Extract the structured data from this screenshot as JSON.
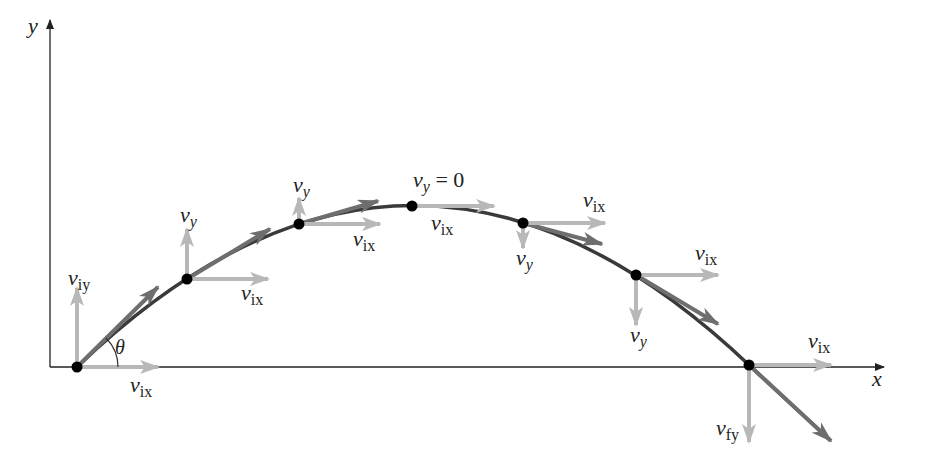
{
  "diagram": {
    "axes": {
      "x_label": "x",
      "y_label": "y"
    },
    "colors": {
      "axis": "#222222",
      "trajectory": "#3a3a3a",
      "velocity_vector": "#6e6e6e",
      "component_vector": "#b8b8b8",
      "point": "#000000"
    },
    "angle_label": "θ",
    "points": [
      {
        "id": "launch",
        "x": 77,
        "y": 367,
        "vx_label": "v",
        "vx_sub": "ix",
        "vy_label": "v",
        "vy_sub": "iy"
      },
      {
        "id": "p1",
        "x": 187,
        "y": 279,
        "vx_label": "v",
        "vx_sub": "ix",
        "vy_label": "v",
        "vy_sub": "y"
      },
      {
        "id": "p2",
        "x": 299,
        "y": 224,
        "vx_label": "v",
        "vx_sub": "ix",
        "vy_label": "v",
        "vy_sub": "y"
      },
      {
        "id": "apex",
        "x": 412,
        "y": 206,
        "vx_label": "v",
        "vx_sub": "ix",
        "vy_label": "v",
        "vy_sub": "y",
        "vy_note": " = 0"
      },
      {
        "id": "p4",
        "x": 523,
        "y": 223,
        "vx_label": "v",
        "vx_sub": "ix",
        "vy_label": "v",
        "vy_sub": "y"
      },
      {
        "id": "p5",
        "x": 636,
        "y": 275,
        "vx_label": "v",
        "vx_sub": "ix",
        "vy_label": "v",
        "vy_sub": "y"
      },
      {
        "id": "landing",
        "x": 749,
        "y": 365,
        "vx_label": "v",
        "vx_sub": "ix",
        "vy_label": "v",
        "vy_sub": "fy"
      }
    ]
  }
}
